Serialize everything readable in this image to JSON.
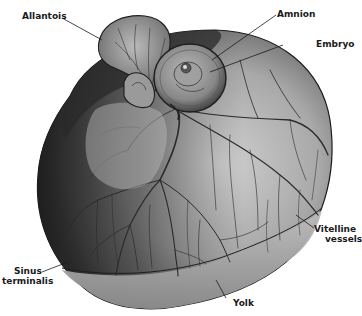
{
  "figure": {
    "labels": {
      "allantois": "Allantois",
      "amnion": "Amnion",
      "embryo": "Embryo",
      "vitelline_line1": "Vitelline",
      "vitelline_line2": "vessels",
      "sinus_line1": "Sinus",
      "sinus_line2": "terminalis",
      "yolk": "Yolk"
    },
    "colors": {
      "background": "#ffffff",
      "yolk_dark": "#3a3a3a",
      "yolk_mid": "#8a8a8a",
      "yolk_light": "#c8c8c8",
      "vessel": "#2a2a2a",
      "label_text": "#1a1a1a"
    }
  }
}
